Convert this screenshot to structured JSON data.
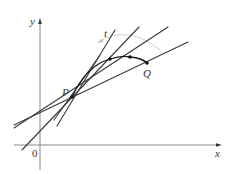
{
  "diagram": {
    "type": "secant-lines-approaching-tangent",
    "labels": {
      "y_axis": "y",
      "x_axis": "x",
      "origin": "0",
      "point_p": "P",
      "point_q": "Q",
      "tangent": "t"
    },
    "colors": {
      "lines": "#3a3a3a",
      "axes": "#6a6a6a",
      "arc": "#1a1a1a",
      "arrow_arc": "#bbbbbb"
    },
    "points": {
      "P": [
        72,
        97
      ],
      "curve_points": [
        [
          110,
          59
        ],
        [
          130,
          57
        ],
        [
          147,
          63
        ]
      ]
    }
  }
}
